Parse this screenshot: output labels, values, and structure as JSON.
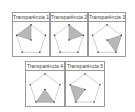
{
  "panels": [
    {
      "title": "Transparência 1",
      "shaded": [
        0,
        4,
        5
      ]
    },
    {
      "title": "Transparência 2",
      "shaded": [
        0,
        1,
        5
      ]
    },
    {
      "title": "Transparência 3",
      "shaded": [
        5,
        1,
        2
      ]
    },
    {
      "title": "Transparência 4",
      "shaded": [
        5,
        2,
        3
      ]
    },
    {
      "title": "Transparência 5",
      "shaded": [
        5,
        3,
        4
      ]
    }
  ],
  "colors": {
    "border": "#9a9a9a",
    "fill": "#b8b8b8",
    "line": "#b0b0b0",
    "dot": "#333333"
  }
}
